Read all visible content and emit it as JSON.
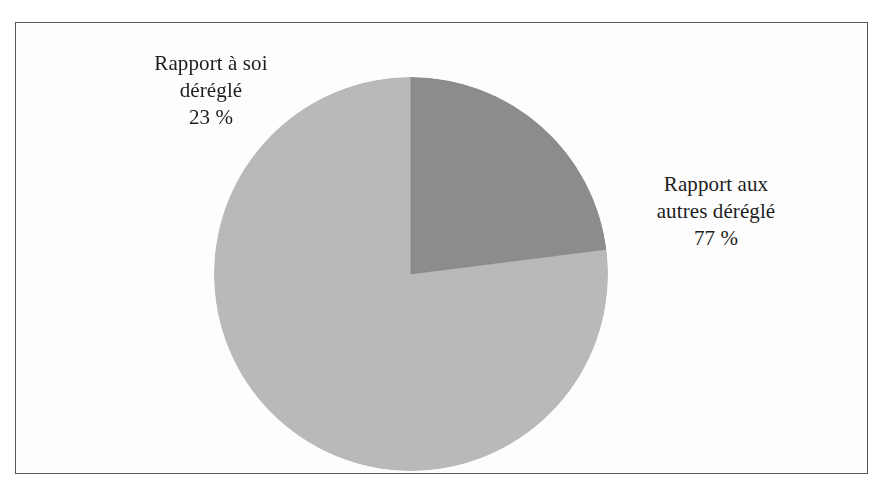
{
  "figure": {
    "frame_color": "#5a5a5a",
    "background": "#fdfdfd"
  },
  "chart_data": {
    "type": "pie",
    "title": "",
    "labels": [
      "Rapport aux autres déréglé",
      "Rapport à soi déréglé"
    ],
    "values": [
      77,
      23
    ],
    "value_labels": [
      "77 %",
      "23 %"
    ],
    "colors": [
      "#b9b9b9",
      "#8c8c8c"
    ],
    "unit": "%",
    "start_angle_deg": 0,
    "direction": "counterclockwise",
    "legend": "none",
    "grid": false,
    "slices": [
      {
        "name": "rapport-aux-autres-deregle",
        "label_lines": [
          "Rapport aux",
          "autres déréglé"
        ],
        "value": 77,
        "value_label": "77 %",
        "color": "#b9b9b9"
      },
      {
        "name": "rapport-a-soi-deregle",
        "label_lines": [
          "Rapport à soi",
          "déréglé"
        ],
        "value": 23,
        "value_label": "23 %",
        "color": "#8c8c8c"
      }
    ]
  },
  "labels": {
    "left": {
      "line1": "Rapport à soi",
      "line2": "déréglé",
      "value": "23 %"
    },
    "right": {
      "line1": "Rapport aux",
      "line2": "autres déréglé",
      "value": "77 %"
    }
  }
}
